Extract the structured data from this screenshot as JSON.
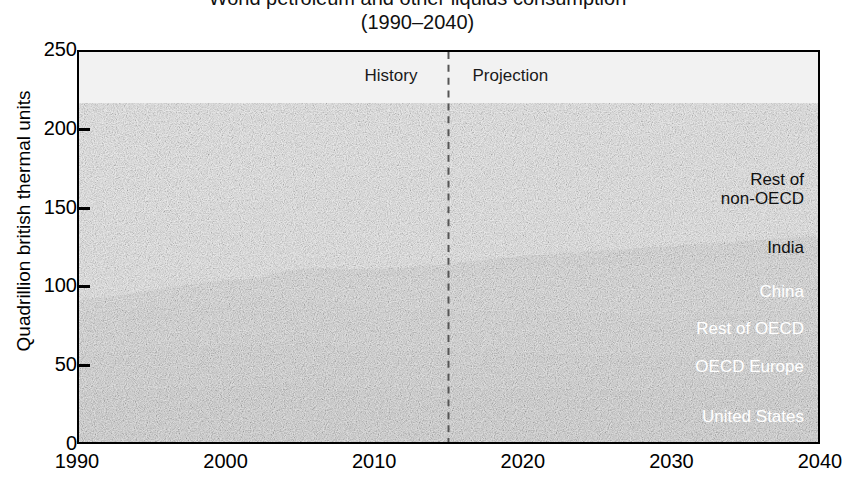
{
  "title": {
    "line1": "World petroleum and other liquids consumption",
    "line2": "(1990–2040)"
  },
  "axes": {
    "ylabel": "Quadrillion british thermal units",
    "yticks": [
      "0",
      "50",
      "100",
      "150",
      "200",
      "250"
    ],
    "xticks": [
      "1990",
      "2000",
      "2010",
      "2020",
      "2030",
      "2040"
    ]
  },
  "annotations": {
    "history": "History",
    "projection": "Projection",
    "divider_year": 2015
  },
  "series_labels": [
    {
      "name": "rest-of-non-oecd",
      "line1": "Rest of",
      "line2": "non-OECD",
      "tone": "dark"
    },
    {
      "name": "india",
      "line1": "India",
      "line2": "",
      "tone": "dark"
    },
    {
      "name": "china",
      "line1": "China",
      "line2": "",
      "tone": "light"
    },
    {
      "name": "rest-of-oecd",
      "line1": "Rest of OECD",
      "line2": "",
      "tone": "light"
    },
    {
      "name": "oecd-europe",
      "line1": "OECD Europe",
      "line2": "",
      "tone": "light"
    },
    {
      "name": "united-states",
      "line1": "United States",
      "line2": "",
      "tone": "light"
    }
  ],
  "chart_data": {
    "type": "area",
    "title": "World petroleum and other liquids consumption (1990–2040)",
    "xlabel": "",
    "ylabel": "Quadrillion british thermal units",
    "xlim": [
      1990,
      2040
    ],
    "ylim": [
      0,
      250
    ],
    "yticks": [
      0,
      50,
      100,
      150,
      200,
      250
    ],
    "xticks": [
      1990,
      2000,
      2010,
      2020,
      2030,
      2040
    ],
    "grid": false,
    "stacked": true,
    "legend": "inline-right-labels",
    "history_projection_divider": 2015,
    "colors": {
      "United States": "#4a4a4a",
      "OECD Europe": "#6c6c6c",
      "Rest of OECD": "#868686",
      "China": "#9a9a9a",
      "India": "#8c8c8c",
      "Rest of non-OECD": "#e6e6e6"
    },
    "x": [
      1990,
      1992,
      1994,
      1996,
      1998,
      2000,
      2002,
      2004,
      2006,
      2008,
      2010,
      2012,
      2014,
      2015,
      2016,
      2018,
      2020,
      2022,
      2024,
      2026,
      2028,
      2030,
      2032,
      2034,
      2036,
      2038,
      2040
    ],
    "series": [
      {
        "name": "United States",
        "values": [
          33.5,
          33.8,
          34.5,
          35.2,
          36.0,
          36.8,
          36.6,
          37.8,
          38.2,
          36.5,
          35.0,
          34.2,
          34.6,
          34.8,
          34.8,
          35.0,
          35.0,
          34.8,
          34.6,
          34.5,
          34.4,
          34.3,
          34.3,
          34.4,
          34.5,
          34.6,
          34.8
        ]
      },
      {
        "name": "OECD Europe",
        "values": [
          25.0,
          25.2,
          25.4,
          26.0,
          26.4,
          26.4,
          26.4,
          26.8,
          26.8,
          26.2,
          25.2,
          24.4,
          23.8,
          23.6,
          23.5,
          23.2,
          23.0,
          22.7,
          22.4,
          22.2,
          22.0,
          21.8,
          21.6,
          21.5,
          21.4,
          21.3,
          21.2
        ]
      },
      {
        "name": "Rest of OECD",
        "values": [
          25.5,
          25.8,
          26.2,
          27.0,
          27.0,
          27.2,
          27.0,
          27.6,
          27.4,
          26.8,
          26.6,
          26.4,
          26.2,
          26.2,
          26.2,
          26.2,
          26.2,
          26.2,
          26.2,
          26.2,
          26.2,
          26.3,
          26.4,
          26.5,
          26.6,
          26.7,
          26.8
        ]
      },
      {
        "name": "China",
        "values": [
          5.0,
          5.6,
          6.4,
          7.4,
          8.2,
          9.4,
          10.4,
          12.4,
          14.0,
          15.4,
          17.6,
          19.4,
          21.2,
          22.0,
          22.8,
          24.2,
          25.6,
          27.0,
          28.2,
          29.2,
          30.2,
          31.0,
          31.8,
          32.4,
          33.0,
          33.6,
          34.2
        ]
      },
      {
        "name": "India",
        "values": [
          2.4,
          2.8,
          3.2,
          3.6,
          4.0,
          4.4,
          4.8,
          5.2,
          5.6,
          6.2,
          6.8,
          7.4,
          7.8,
          8.0,
          8.3,
          8.8,
          9.4,
          10.0,
          10.6,
          11.2,
          11.8,
          12.4,
          13.0,
          13.6,
          14.2,
          14.8,
          15.4
        ]
      },
      {
        "name": "Rest of non-OECD",
        "values": [
          44.6,
          45.8,
          46.8,
          48.0,
          48.8,
          50.2,
          51.4,
          53.6,
          55.4,
          56.6,
          58.0,
          59.6,
          60.8,
          61.2,
          62.0,
          63.4,
          65.0,
          66.8,
          68.6,
          70.4,
          72.2,
          74.0,
          76.0,
          78.0,
          80.2,
          82.4,
          84.6
        ]
      }
    ],
    "totals": [
      136.0,
      139.0,
      142.5,
      147.2,
      150.4,
      154.4,
      156.6,
      163.4,
      167.4,
      167.7,
      169.2,
      171.4,
      174.4,
      175.8,
      177.6,
      180.8,
      184.2,
      187.5,
      190.6,
      193.7,
      196.8,
      199.8,
      203.1,
      206.4,
      209.9,
      213.4,
      217.0
    ]
  }
}
